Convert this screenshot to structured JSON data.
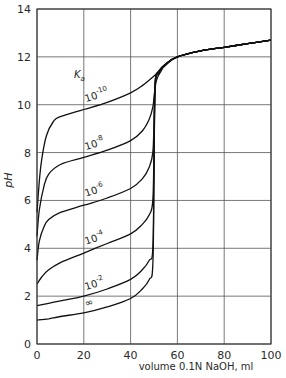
{
  "chart_data": {
    "type": "line",
    "title": "",
    "xlabel": "volume 0.1N NaOH, ml",
    "ylabel": "pH",
    "xlim": [
      0,
      100
    ],
    "ylim": [
      0,
      14
    ],
    "xticks": [
      0,
      20,
      40,
      60,
      80,
      100
    ],
    "yticks": [
      0,
      2,
      4,
      6,
      8,
      10,
      12,
      14
    ],
    "grid": true,
    "legend_title": "Ka",
    "series": [
      {
        "name": "∞",
        "label_base": "",
        "label_exp": "",
        "label_symbol": "∞",
        "x": [
          0,
          5,
          10,
          20,
          30,
          40,
          45,
          48,
          49.5,
          50,
          50.5,
          52,
          55,
          60,
          70,
          80,
          90,
          100
        ],
        "y": [
          1.0,
          1.05,
          1.15,
          1.3,
          1.55,
          1.9,
          2.3,
          2.7,
          3.3,
          7.0,
          10.7,
          11.3,
          11.7,
          12.0,
          12.25,
          12.4,
          12.55,
          12.7
        ]
      },
      {
        "name": "10^-2",
        "label_base": "10",
        "label_exp": "-2",
        "x": [
          0,
          5,
          10,
          20,
          30,
          40,
          45,
          48,
          49.5,
          50,
          50.5,
          52,
          55,
          60,
          70,
          80,
          90,
          100
        ],
        "y": [
          1.6,
          1.7,
          1.8,
          2.0,
          2.3,
          2.7,
          3.1,
          3.5,
          4.0,
          7.3,
          10.8,
          11.35,
          11.7,
          12.0,
          12.25,
          12.4,
          12.55,
          12.7
        ]
      },
      {
        "name": "10^-4",
        "label_base": "10",
        "label_exp": "-4",
        "x": [
          0,
          2,
          5,
          10,
          20,
          30,
          40,
          45,
          48,
          49.5,
          50,
          50.5,
          52,
          55,
          60,
          70,
          80,
          90,
          100
        ],
        "y": [
          2.5,
          2.8,
          3.1,
          3.4,
          3.8,
          4.2,
          4.6,
          5.0,
          5.4,
          6.0,
          8.2,
          10.9,
          11.4,
          11.7,
          12.0,
          12.25,
          12.4,
          12.55,
          12.7
        ]
      },
      {
        "name": "10^-6",
        "label_base": "10",
        "label_exp": "-6",
        "x": [
          0,
          1,
          3,
          5,
          10,
          20,
          30,
          40,
          45,
          48,
          49.5,
          50,
          50.5,
          52,
          55,
          60,
          70,
          80,
          90,
          100
        ],
        "y": [
          3.5,
          4.3,
          4.9,
          5.2,
          5.5,
          5.8,
          6.1,
          6.5,
          6.9,
          7.4,
          8.0,
          9.3,
          11.0,
          11.4,
          11.7,
          12.0,
          12.25,
          12.4,
          12.55,
          12.7
        ]
      },
      {
        "name": "10^-8",
        "label_base": "10",
        "label_exp": "-8",
        "x": [
          0,
          1,
          3,
          5,
          10,
          20,
          30,
          40,
          45,
          48,
          49.5,
          50,
          51,
          53,
          55,
          60,
          70,
          80,
          90,
          100
        ],
        "y": [
          4.5,
          5.6,
          6.6,
          7.1,
          7.5,
          7.8,
          8.1,
          8.5,
          8.9,
          9.4,
          9.9,
          10.3,
          11.0,
          11.4,
          11.7,
          12.0,
          12.25,
          12.4,
          12.55,
          12.7
        ]
      },
      {
        "name": "10^-10",
        "label_base": "10",
        "label_exp": "-10",
        "x": [
          0,
          1,
          2,
          4,
          7,
          10,
          20,
          30,
          40,
          45,
          50,
          55,
          60,
          70,
          80,
          90,
          100
        ],
        "y": [
          5.5,
          6.8,
          7.7,
          8.7,
          9.3,
          9.5,
          9.8,
          10.1,
          10.5,
          10.8,
          11.2,
          11.65,
          12.0,
          12.25,
          12.4,
          12.55,
          12.7
        ]
      }
    ],
    "curve_label_positions": [
      {
        "series": "∞",
        "x": 21,
        "y": 1.55
      },
      {
        "series": "10^-2",
        "x": 21,
        "y": 2.25
      },
      {
        "series": "10^-4",
        "x": 21,
        "y": 4.15
      },
      {
        "series": "10^-6",
        "x": 21,
        "y": 6.15
      },
      {
        "series": "10^-8",
        "x": 21,
        "y": 8.1
      },
      {
        "series": "10^-10",
        "x": 21,
        "y": 10.1
      }
    ],
    "annotations": [
      {
        "text": "Ka",
        "x": 20,
        "y": 11.3
      }
    ]
  },
  "axes": {
    "ylabel": "pH",
    "xlabel": "volume 0.1N NaOH, ml",
    "legend_title_base": "K",
    "legend_title_sub": "a"
  }
}
